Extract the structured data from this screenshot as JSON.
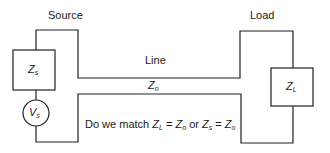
{
  "labels": {
    "source": "Source",
    "load": "Load",
    "line": "Line"
  },
  "components": {
    "source_impedance": {
      "symbol": "Z",
      "sub": "s"
    },
    "source_voltage": {
      "symbol": "V",
      "sub": "s"
    },
    "line_impedance": {
      "symbol": "Z",
      "sub": "o"
    },
    "load_impedance": {
      "symbol": "Z",
      "sub": "L"
    }
  },
  "question": {
    "prefix": "Do we match ",
    "z1": "Z",
    "z1_sub": "L",
    "eq1": " = ",
    "z2": "Z",
    "z2_sub": "o",
    "or": " or ",
    "z3": "Z",
    "z3_sub": "s",
    "eq2": " = ",
    "z4": "Z",
    "z4_sub": "o"
  }
}
